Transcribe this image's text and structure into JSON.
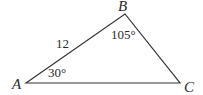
{
  "diagram": {
    "type": "triangle",
    "stroke_color": "#333333",
    "vertices": [
      {
        "name": "A",
        "x": 26,
        "y": 83,
        "label_x": 12,
        "label_y": 89
      },
      {
        "name": "B",
        "x": 125,
        "y": 14,
        "label_x": 118,
        "label_y": 11
      },
      {
        "name": "C",
        "x": 180,
        "y": 83,
        "label_x": 184,
        "label_y": 92
      }
    ],
    "side_labels": [
      {
        "side": "AB",
        "text": "12",
        "x": 56,
        "y": 48
      }
    ],
    "angle_labels": [
      {
        "vertex": "A",
        "text": "30°",
        "x": 48,
        "y": 77
      },
      {
        "vertex": "B",
        "text": "105°",
        "x": 111,
        "y": 39
      }
    ]
  }
}
